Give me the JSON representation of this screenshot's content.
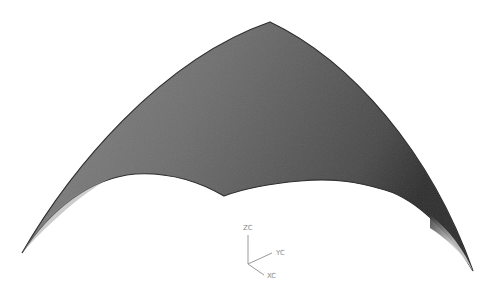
{
  "viewport": {
    "background": "#ffffff",
    "surface": {
      "name": "curved-triangular-surface-patch",
      "fill_dark": "#3c3c3c",
      "fill_mid": "#6e6e6e",
      "fill_light": "#8a8a8a",
      "edge_color": "#2a2a2a"
    },
    "triad": {
      "labels": {
        "z": "ZC",
        "y": "YC",
        "x": "XC"
      },
      "color": "#9a9a9a"
    }
  }
}
